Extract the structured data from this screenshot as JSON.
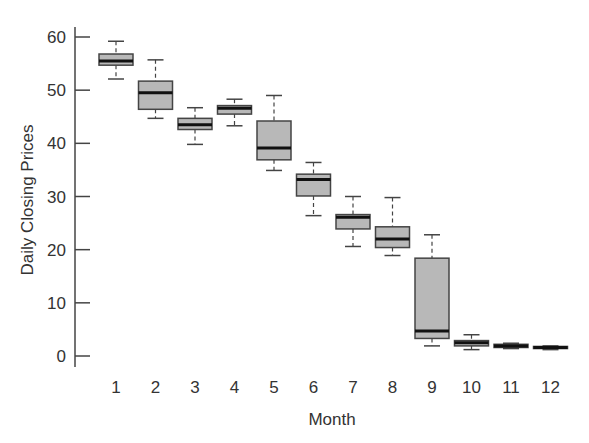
{
  "chart_data": {
    "type": "box",
    "title": "",
    "xlabel": "Month",
    "ylabel": "Daily Closing Prices",
    "ylim": [
      0,
      60
    ],
    "yticks": [
      0,
      10,
      20,
      30,
      40,
      50,
      60
    ],
    "categories": [
      "1",
      "2",
      "3",
      "4",
      "5",
      "6",
      "7",
      "8",
      "9",
      "10",
      "11",
      "12"
    ],
    "grid": false,
    "legend": null,
    "colors": {
      "box_fill": "#b8b8b8",
      "box_stroke": "#444444",
      "median": "#111111",
      "axis": "#444444"
    },
    "boxes": [
      {
        "month": "1",
        "whisker_low": 52.1,
        "q1": 54.7,
        "median": 55.5,
        "q3": 56.8,
        "whisker_high": 59.2
      },
      {
        "month": "2",
        "whisker_low": 44.7,
        "q1": 46.4,
        "median": 49.5,
        "q3": 51.7,
        "whisker_high": 55.7
      },
      {
        "month": "3",
        "whisker_low": 39.8,
        "q1": 42.6,
        "median": 43.5,
        "q3": 44.7,
        "whisker_high": 46.7
      },
      {
        "month": "4",
        "whisker_low": 43.3,
        "q1": 45.5,
        "median": 46.6,
        "q3": 47.1,
        "whisker_high": 48.3
      },
      {
        "month": "5",
        "whisker_low": 34.9,
        "q1": 36.9,
        "median": 39.1,
        "q3": 44.2,
        "whisker_high": 49.0
      },
      {
        "month": "6",
        "whisker_low": 26.4,
        "q1": 30.1,
        "median": 33.2,
        "q3": 34.2,
        "whisker_high": 36.4
      },
      {
        "month": "7",
        "whisker_low": 20.6,
        "q1": 23.9,
        "median": 26.1,
        "q3": 26.6,
        "whisker_high": 30.0
      },
      {
        "month": "8",
        "whisker_low": 18.9,
        "q1": 20.4,
        "median": 22.0,
        "q3": 24.3,
        "whisker_high": 29.8
      },
      {
        "month": "9",
        "whisker_low": 1.9,
        "q1": 3.3,
        "median": 4.7,
        "q3": 18.4,
        "whisker_high": 22.8
      },
      {
        "month": "10",
        "whisker_low": 1.2,
        "q1": 1.9,
        "median": 2.5,
        "q3": 2.9,
        "whisker_high": 4.0
      },
      {
        "month": "11",
        "whisker_low": 1.4,
        "q1": 1.6,
        "median": 1.9,
        "q3": 2.2,
        "whisker_high": 2.4
      },
      {
        "month": "12",
        "whisker_low": 1.2,
        "q1": 1.4,
        "median": 1.6,
        "q3": 1.8,
        "whisker_high": 1.9
      }
    ]
  }
}
